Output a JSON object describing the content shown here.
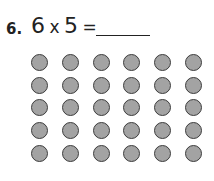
{
  "problem": {
    "number": "6.",
    "operand_a": "6",
    "operator": "x",
    "operand_b": "5",
    "equals": "=",
    "answer": ""
  },
  "array": {
    "rows": 5,
    "columns": 6,
    "fill_color": "#a3a3a3",
    "stroke_color": "#3d3d3d"
  }
}
